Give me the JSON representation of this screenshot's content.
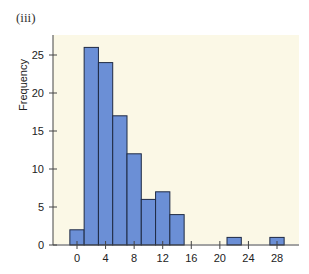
{
  "panel_label": "(iii)",
  "chart_data": {
    "type": "bar",
    "title": "",
    "xlabel": "",
    "ylabel": "Frequency",
    "bin_width": 2,
    "categories": [
      0,
      2,
      4,
      6,
      8,
      10,
      12,
      14,
      22,
      28
    ],
    "values": [
      2,
      26,
      24,
      17,
      12,
      6,
      7,
      4,
      1,
      1
    ],
    "xticks": [
      0,
      4,
      8,
      12,
      16,
      20,
      24,
      28
    ],
    "yticks": [
      0,
      5,
      10,
      15,
      20,
      25
    ],
    "xlim": [
      -3.5,
      29.5
    ],
    "ylim": [
      0,
      27
    ],
    "grid": false,
    "bar_color": "#6b8fd6",
    "bar_edge": "#1f2a44",
    "background": "#fbf8e6"
  }
}
